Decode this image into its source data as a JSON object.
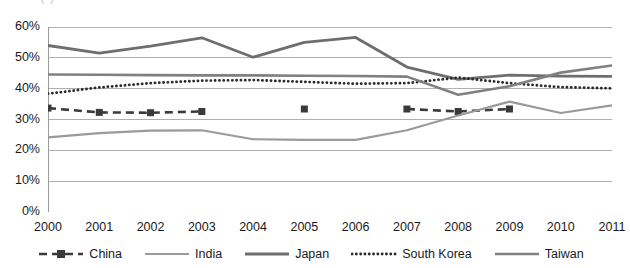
{
  "chart_data": {
    "type": "line",
    "title": "",
    "xlabel": "",
    "ylabel": "",
    "x": [
      2000,
      2001,
      2002,
      2003,
      2004,
      2005,
      2006,
      2007,
      2008,
      2009,
      2010,
      2011
    ],
    "xlim": [
      2000,
      2011
    ],
    "ylim": [
      0,
      60
    ],
    "ytick_labels": [
      "0%",
      "10%",
      "20%",
      "30%",
      "40%",
      "50%",
      "60%"
    ],
    "ytick_values": [
      0,
      10,
      20,
      30,
      40,
      50,
      60
    ],
    "xtick_labels": [
      "2000",
      "2001",
      "2002",
      "2003",
      "2004",
      "2005",
      "2006",
      "2007",
      "2008",
      "2009",
      "2010",
      "2011"
    ],
    "grid": "horizontal",
    "legend_position": "bottom",
    "series": [
      {
        "name": "China",
        "style": "dashed-marker",
        "marker": "square",
        "color": "#3a3a3a",
        "width": 2.6,
        "values": [
          33.7,
          32.3,
          32.2,
          32.6,
          null,
          33.4,
          null,
          33.4,
          32.6,
          33.4,
          null,
          null
        ]
      },
      {
        "name": "India",
        "style": "solid",
        "color": "#9a9a9a",
        "width": 2.2,
        "values": [
          24.2,
          25.6,
          26.4,
          26.5,
          23.6,
          23.4,
          23.4,
          26.5,
          31.3,
          35.8,
          32.1,
          34.6
        ]
      },
      {
        "name": "Japan",
        "style": "solid",
        "color": "#6e6e6e",
        "width": 2.8,
        "values": [
          54.0,
          51.5,
          53.8,
          56.5,
          50.2,
          55.0,
          56.6,
          47.0,
          43.0,
          44.4,
          44.1,
          44.0
        ]
      },
      {
        "name": "South Korea",
        "style": "dotted",
        "color": "#2b2b2b",
        "width": 2.6,
        "values": [
          38.4,
          40.4,
          41.8,
          42.6,
          42.8,
          42.2,
          41.6,
          41.8,
          43.6,
          41.8,
          40.5,
          40.1
        ]
      },
      {
        "name": "Taiwan",
        "style": "solid",
        "color": "#808080",
        "width": 2.6,
        "values": [
          44.6,
          44.5,
          44.4,
          44.3,
          44.3,
          44.2,
          44.1,
          43.9,
          38.0,
          40.8,
          45.2,
          47.5
        ]
      }
    ]
  },
  "legend": {
    "items": [
      {
        "label": "China",
        "swatch": "dashed-square-marker"
      },
      {
        "label": "India",
        "swatch": "solid-light-line"
      },
      {
        "label": "Japan",
        "swatch": "solid-dark-line"
      },
      {
        "label": "South Korea",
        "swatch": "dotted-line"
      },
      {
        "label": "Taiwan",
        "swatch": "solid-medium-line"
      }
    ]
  },
  "axis": {
    "y_labels": [
      "60%",
      "50%",
      "40%",
      "30%",
      "20%",
      "10%",
      "0%"
    ],
    "x_labels": [
      "2000",
      "2001",
      "2002",
      "2003",
      "2004",
      "2005",
      "2006",
      "2007",
      "2008",
      "2009",
      "2010",
      "2011"
    ]
  },
  "title_clip": "(     )"
}
